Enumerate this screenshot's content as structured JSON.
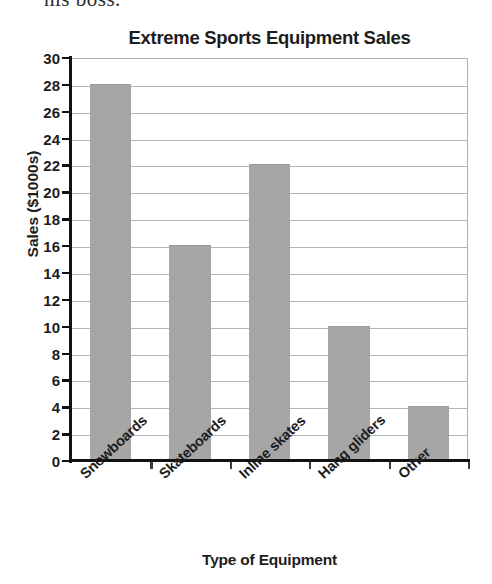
{
  "page_fragment": {
    "text": "his boss."
  },
  "chart_data": {
    "type": "bar",
    "title": "Extreme Sports Equipment Sales",
    "xlabel": "Type of Equipment",
    "ylabel": "Sales ($1000s)",
    "categories": [
      "Snowboards",
      "Skateboards",
      "Inline skates",
      "Hang gliders",
      "Other"
    ],
    "values": [
      28,
      16,
      22,
      10,
      4
    ],
    "ylim": [
      0,
      30
    ],
    "ytick_step": 2,
    "yticks": [
      30,
      28,
      26,
      24,
      22,
      20,
      18,
      16,
      14,
      12,
      10,
      8,
      6,
      4,
      2,
      0
    ],
    "ytick_labels": [
      "30",
      "28",
      "26",
      "24",
      "22",
      "20",
      "18",
      "16",
      "14",
      "12",
      "10",
      "8",
      "6",
      "4",
      "2",
      "0"
    ],
    "grid": true,
    "grid_axis": "y",
    "legend": false,
    "bar_color": "#a6a6a6",
    "gridline_color": "#b5b5b5",
    "axis_color": "#111111",
    "text_color": "#1d1d1d",
    "background_color": "#ffffff"
  }
}
